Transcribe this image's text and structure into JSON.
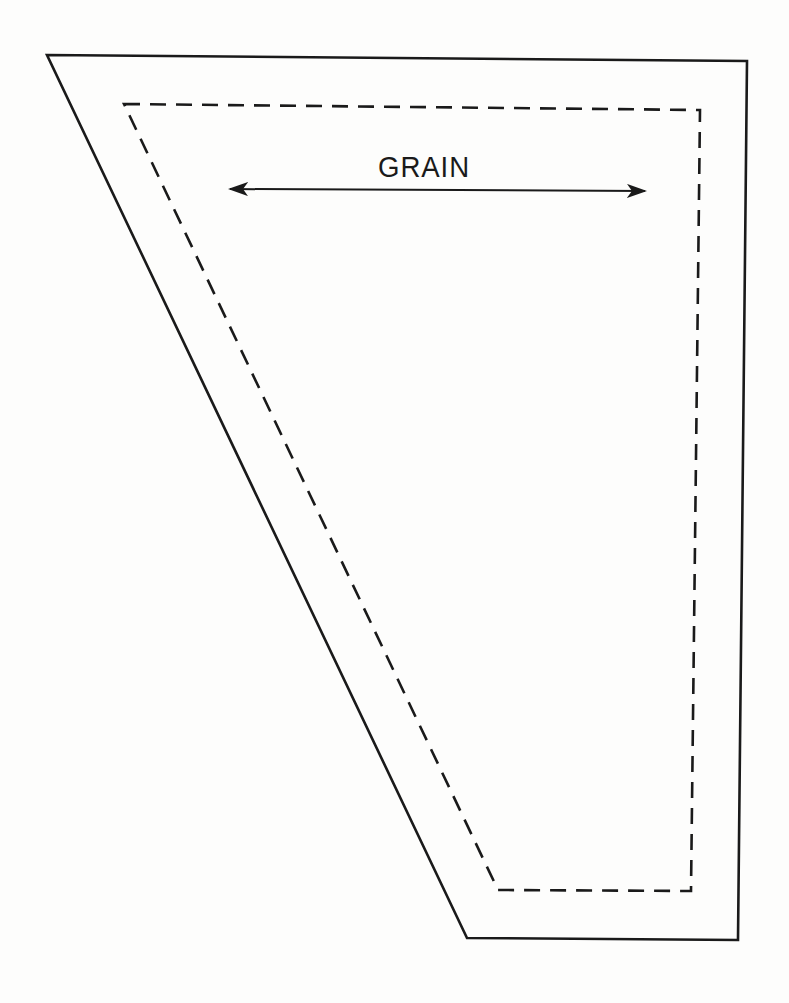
{
  "diagram": {
    "type": "sewing-pattern-piece",
    "grain_label": "GRAIN",
    "colors": {
      "ink": "#1a1a1a",
      "paper": "#fdfdfc"
    },
    "outer_cut_line": {
      "style": "solid",
      "points": [
        [
          47,
          55
        ],
        [
          747,
          61
        ],
        [
          738,
          940
        ],
        [
          467,
          938
        ]
      ]
    },
    "inner_seam_line": {
      "style": "dashed",
      "points": [
        [
          124,
          104
        ],
        [
          700,
          110
        ],
        [
          691,
          891
        ],
        [
          498,
          890
        ]
      ]
    },
    "grain_arrow": {
      "from": [
        230,
        189
      ],
      "to": [
        645,
        191
      ],
      "heads": "both"
    }
  }
}
